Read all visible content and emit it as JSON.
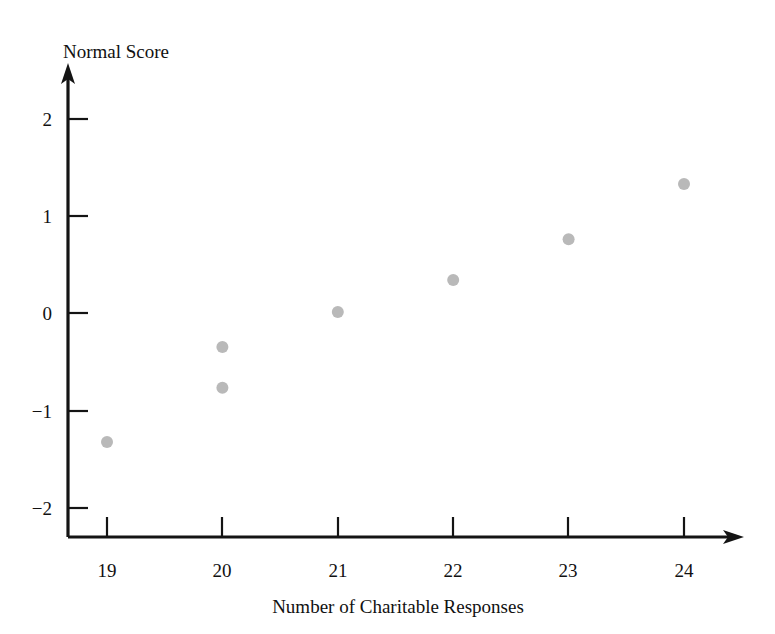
{
  "chart_data": {
    "type": "scatter",
    "title": "",
    "xlabel": "Number of Charitable Responses",
    "ylabel": "Normal Score",
    "xlim": [
      18.5,
      24.6
    ],
    "ylim": [
      -2.35,
      2.3
    ],
    "xticks": [
      "19",
      "20",
      "21",
      "22",
      "23",
      "24"
    ],
    "xtick_values": [
      19,
      20,
      21,
      22,
      23,
      24
    ],
    "yticks": [
      "2",
      "1",
      "0",
      "−1",
      "−2"
    ],
    "ytick_values": [
      2,
      1,
      0,
      -1,
      -2
    ],
    "grid": false,
    "legend": null,
    "marker": {
      "shape": "circle",
      "color": "#b9b9b9",
      "radius_px": 6
    },
    "series": [
      {
        "name": "Normal probability plot",
        "points": [
          {
            "x": 19,
            "y": -1.33
          },
          {
            "x": 20,
            "y": -0.35
          },
          {
            "x": 20,
            "y": -0.77
          },
          {
            "x": 21,
            "y": 0.01
          },
          {
            "x": 22,
            "y": 0.34
          },
          {
            "x": 23,
            "y": 0.76
          },
          {
            "x": 24,
            "y": 1.33
          }
        ]
      }
    ],
    "axis_style": {
      "x_axis_arrow": true,
      "y_axis_arrow": true,
      "axis_color": "#141414"
    }
  }
}
